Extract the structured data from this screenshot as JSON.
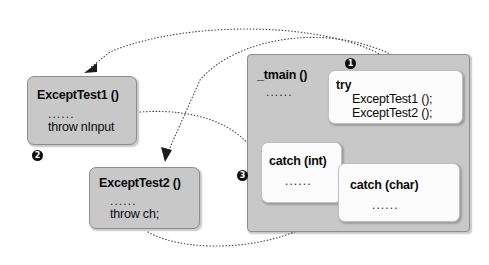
{
  "diagram": {
    "colors": {
      "gray_box": "#c8c8c8",
      "white_box": "#fbfbfb",
      "arrow": "#4a4a4a",
      "badge": "#0d0d0d",
      "text": "#0b0b0b"
    }
  },
  "ellipsis": "......",
  "functions": {
    "except_test1": {
      "title": "ExceptTest1 ()",
      "ellipsis": "......",
      "statement": "throw nInput",
      "badge": "2"
    },
    "except_test2": {
      "title": "ExceptTest2 ()",
      "ellipsis": "......",
      "statement": "throw ch;",
      "badge": "3"
    }
  },
  "main": {
    "title": "_tmain ()",
    "ellipsis": "......",
    "try_block": {
      "keyword": "try",
      "badge": "1",
      "calls": [
        "ExceptTest1 ();",
        "ExceptTest2 ();"
      ]
    },
    "catch_blocks": [
      {
        "label": "catch (int)",
        "ellipsis": "......"
      },
      {
        "label": "catch (char)",
        "ellipsis": "......"
      }
    ]
  },
  "badges": {
    "one": "1",
    "two": "2",
    "three": "3"
  }
}
